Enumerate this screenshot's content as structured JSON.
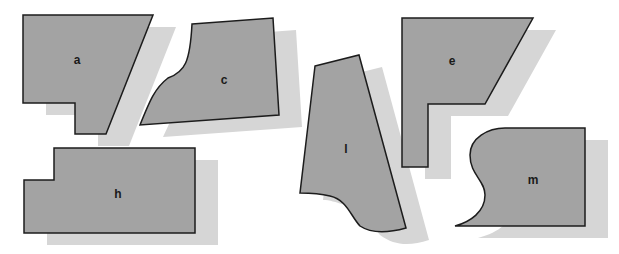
{
  "colors": {
    "background": "#ffffff",
    "piece_fill": "#a3a3a3",
    "piece_stroke": "#1c1c1c",
    "shadow_fill": "#d6d6d6"
  },
  "pieces": [
    {
      "id": "a",
      "label": "a"
    },
    {
      "id": "c",
      "label": "c"
    },
    {
      "id": "l",
      "label": "l"
    },
    {
      "id": "e",
      "label": "e"
    },
    {
      "id": "h",
      "label": "h"
    },
    {
      "id": "m",
      "label": "m"
    }
  ]
}
